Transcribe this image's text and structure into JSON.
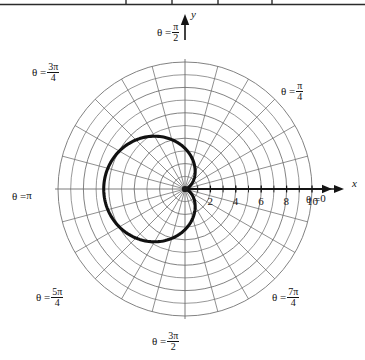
{
  "figure": {
    "kind": "polar-graph",
    "background": "#ffffff",
    "ink_color": "#141414",
    "grid_color": "#6b6b6b",
    "curve_color": "#111111",
    "top_rule": {
      "present": true,
      "segment_ticks": 4
    }
  },
  "axes": {
    "x_label": "x",
    "y_label": "y",
    "x_ticks": [
      {
        "value": "2",
        "r": 2
      },
      {
        "value": "4",
        "r": 4
      },
      {
        "value": "6",
        "r": 6
      },
      {
        "value": "8",
        "r": 8
      },
      {
        "value": "10",
        "r": 10
      }
    ]
  },
  "theta_labels": [
    {
      "id": "theta-0",
      "prefix": "θ = ",
      "whole": "0",
      "num": "",
      "den": "",
      "angle_deg": 0
    },
    {
      "id": "theta-pi-4",
      "prefix": "θ = ",
      "whole": "",
      "num": "π",
      "den": "4",
      "angle_deg": 45
    },
    {
      "id": "theta-pi-2",
      "prefix": "θ = ",
      "whole": "",
      "num": "π",
      "den": "2",
      "angle_deg": 90
    },
    {
      "id": "theta-3pi-4",
      "prefix": "θ = ",
      "whole": "",
      "num": "3π",
      "den": "4",
      "angle_deg": 135
    },
    {
      "id": "theta-pi",
      "prefix": "θ = ",
      "whole": "π",
      "num": "",
      "den": "",
      "angle_deg": 180
    },
    {
      "id": "theta-5pi-4",
      "prefix": "θ = ",
      "whole": "",
      "num": "5π",
      "den": "4",
      "angle_deg": 225
    },
    {
      "id": "theta-3pi-2",
      "prefix": "θ = ",
      "whole": "",
      "num": "3π",
      "den": "2",
      "angle_deg": 270
    },
    {
      "id": "theta-7pi-4",
      "prefix": "θ = ",
      "whole": "",
      "num": "7π",
      "den": "4",
      "angle_deg": 315
    }
  ],
  "chart_data": {
    "type": "line",
    "coordinate_system": "polar",
    "title": "",
    "xlabel": "x",
    "ylabel": "y",
    "grid": true,
    "legend": "none",
    "origin_px": [
      185,
      189
    ],
    "pixels_per_unit": 12.7,
    "polar_grid": {
      "circle_radii": [
        1,
        2,
        3,
        4,
        5,
        6,
        7,
        8,
        9,
        10
      ],
      "ray_count": 24,
      "ray_step_deg": 15,
      "rmax": 10
    },
    "series": [
      {
        "name": "cardioid",
        "equation": "r = 3.2(1 - cos(theta))",
        "amplitude": 3.2,
        "max_r": 6.4,
        "cusp_at_origin": true,
        "opens": "left",
        "theta_deg": [
          0,
          15,
          30,
          45,
          60,
          75,
          90,
          105,
          120,
          135,
          150,
          165,
          180,
          195,
          210,
          225,
          240,
          255,
          270,
          285,
          300,
          315,
          330,
          345,
          360
        ],
        "r": [
          0.0,
          0.11,
          0.43,
          0.94,
          1.6,
          2.37,
          3.2,
          4.03,
          4.8,
          5.46,
          5.97,
          6.29,
          6.4,
          6.29,
          5.97,
          5.46,
          4.8,
          4.03,
          3.2,
          2.37,
          1.6,
          0.94,
          0.43,
          0.11,
          0.0
        ]
      }
    ],
    "axis_ranges": {
      "x": [
        -10,
        10
      ],
      "y": [
        -10,
        10
      ]
    }
  }
}
